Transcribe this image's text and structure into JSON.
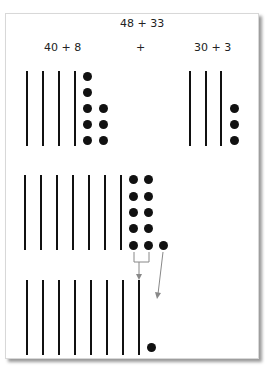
{
  "title": "48 + 33",
  "left_label": "40 + 8",
  "plus_sign": "+",
  "right_label": "30 + 3",
  "rows": [
    {
      "name": "addends",
      "description": "48 shown as 4 tens sticks and 8 dots; 33 shown as 3 tens sticks and 3 dots",
      "left_tens": 4,
      "left_ones": 8,
      "right_tens": 3,
      "right_ones": 3
    },
    {
      "name": "combined",
      "description": "7 tens sticks and 11 dots",
      "tens": 7,
      "ones": 11
    },
    {
      "name": "regrouped",
      "description": "10 dots regrouped into 1 ten: 8 tens sticks and 1 dot",
      "tens": 8,
      "ones": 1
    }
  ],
  "colors": {
    "ink": "#111111",
    "arrow": "#888888",
    "shadow": "#9a9a9a"
  }
}
